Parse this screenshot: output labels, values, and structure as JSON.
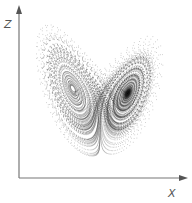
{
  "figure": {
    "axes": {
      "vertical_label": "Z",
      "horizontal_label": "X",
      "color": "#777777"
    },
    "attractor": {
      "system": "lorenz",
      "sigma": 10,
      "rho": 28,
      "beta": 2.6667,
      "point_color": "#222222",
      "lobes": [
        "left-lobe",
        "right-lobe"
      ]
    }
  }
}
